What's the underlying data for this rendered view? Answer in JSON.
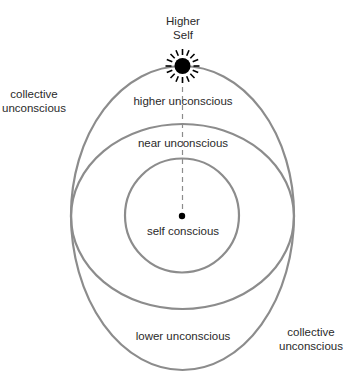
{
  "diagram": {
    "title": "Higher Self",
    "title_lines": [
      "Higher",
      "Self"
    ],
    "regions": {
      "higher_unconscious": "higher unconscious",
      "near_unconscious": "near unconscious",
      "self_conscious": "self conscious",
      "lower_unconscious": "lower unconscious",
      "collective_unconscious_left": [
        "collective",
        "unconscious"
      ],
      "collective_unconscious_right": [
        "collective",
        "unconscious"
      ]
    },
    "icons": {
      "higher_self": "sun-icon",
      "self": "dot-icon"
    },
    "colors": {
      "stroke": "#8c8c8c",
      "sun": "#000000",
      "text": "#2a2a2a",
      "background": "#ffffff"
    },
    "shapes": {
      "outer_egg": {
        "cx": 182.5,
        "cy": 215,
        "rx": 111.5,
        "ry_top": 149,
        "ry_bottom": 155
      },
      "middle_ellipse": {
        "cx": 182.5,
        "cy": 216.5,
        "rx": 111.5,
        "ry": 92.5
      },
      "inner_circle": {
        "cx": 182,
        "cy": 215.5,
        "r": 57
      },
      "sun": {
        "cx": 182.5,
        "cy": 66,
        "r": 8,
        "ray_inner": 11,
        "ray_outer": 17,
        "ray_count": 16
      },
      "self_dot": {
        "cx": 182,
        "cy": 216,
        "r": 3.2
      }
    }
  }
}
